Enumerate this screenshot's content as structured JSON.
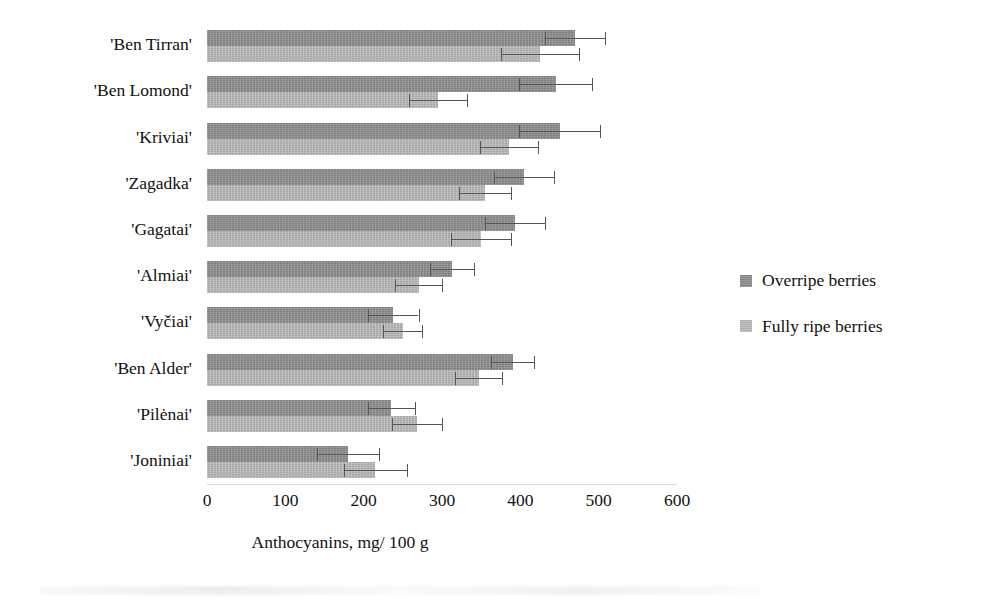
{
  "chart_data": {
    "type": "bar",
    "orientation": "horizontal",
    "title": "",
    "xlabel": "Anthocyanins, mg/ 100 g",
    "ylabel": "",
    "xlim": [
      0,
      600
    ],
    "xticks": [
      0,
      100,
      200,
      300,
      400,
      500,
      600
    ],
    "grid": false,
    "legend_position": "right",
    "categories": [
      "'Ben Tirran'",
      "'Ben Lomond'",
      "'Kriviai'",
      "'Zagadka'",
      "'Gagatai'",
      "'Almiai'",
      "'Vyčiai'",
      "'Ben Alder'",
      "'Pilėnai'",
      "'Joniniai'"
    ],
    "series": [
      {
        "name": "Overripe berries",
        "color": "#8d8d8d",
        "values": [
          470,
          445,
          450,
          405,
          393,
          313,
          238,
          390,
          235,
          180
        ],
        "errors": [
          38,
          47,
          52,
          38,
          38,
          28,
          32,
          28,
          30,
          40
        ]
      },
      {
        "name": "Fully ripe berries",
        "color": "#b4b4b4",
        "values": [
          425,
          295,
          385,
          355,
          350,
          270,
          250,
          347,
          268,
          215
        ],
        "errors": [
          50,
          37,
          37,
          33,
          38,
          30,
          25,
          30,
          32,
          40
        ]
      }
    ]
  },
  "axis": {
    "x_title": "Anthocyanins, mg/ 100 g",
    "tick_labels": [
      "0",
      "100",
      "200",
      "300",
      "400",
      "500",
      "600"
    ]
  },
  "legend": {
    "items": [
      {
        "label": "Overripe berries",
        "swatch": "overripe-swatch"
      },
      {
        "label": "Fully ripe berries",
        "swatch": "fullyripe-swatch"
      }
    ]
  }
}
